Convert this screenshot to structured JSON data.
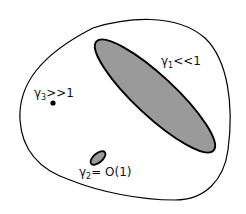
{
  "diagram": {
    "type": "region-diagram",
    "colors": {
      "background": "#ffffff",
      "outline": "#000000",
      "region_fill": "#9a9a9a"
    },
    "regions": [
      {
        "id": "gamma1",
        "shape": "large-ellipse",
        "label": {
          "symbol": "γ",
          "subscript": "1",
          "relation": "<<1"
        }
      },
      {
        "id": "gamma2",
        "shape": "small-ellipse",
        "label": {
          "symbol": "γ",
          "subscript": "2",
          "relation": "= O(1)"
        }
      },
      {
        "id": "gamma3",
        "shape": "point",
        "label": {
          "symbol": "γ",
          "subscript": "3",
          "relation": ">>1"
        }
      }
    ]
  }
}
